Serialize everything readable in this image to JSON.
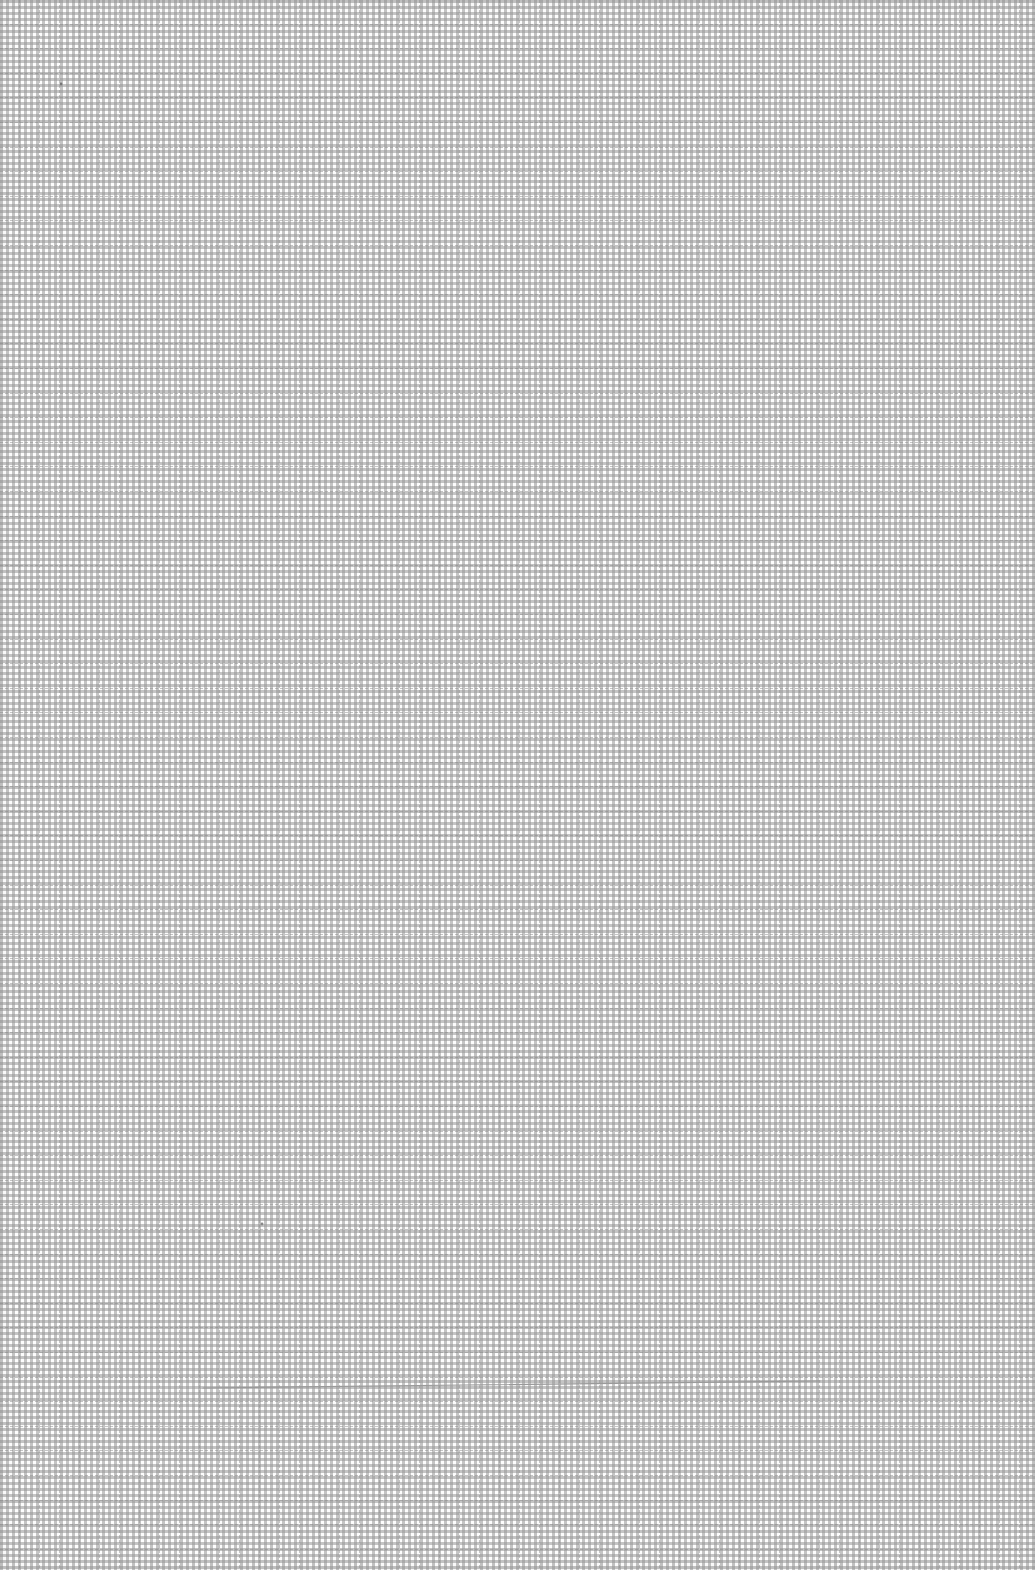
{
  "page": {
    "type": "graph-paper-sheet",
    "grid": {
      "cell_width_px": 20,
      "cell_height_px": 24.6,
      "line_style": "dashed",
      "line_color": "#a0a0a0",
      "paper_color": "#fdfdfd"
    },
    "marks": [
      {
        "kind": "pencil-line",
        "x1": 203,
        "y1": 1388,
        "x2": 820,
        "y2": 1381,
        "color": "#9a9a9a"
      },
      {
        "kind": "dot",
        "x": 61,
        "y": 84,
        "color": "#777777"
      },
      {
        "kind": "dot",
        "x": 262,
        "y": 1224,
        "color": "#888888"
      }
    ]
  }
}
